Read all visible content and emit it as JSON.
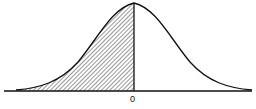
{
  "diagram": {
    "type": "normal-distribution-curve",
    "shaded_region": "left half (below 0)",
    "x_axis_label": "0",
    "colors": {
      "line": "#111111",
      "hatch": "#333333",
      "background": "#ffffff"
    }
  }
}
